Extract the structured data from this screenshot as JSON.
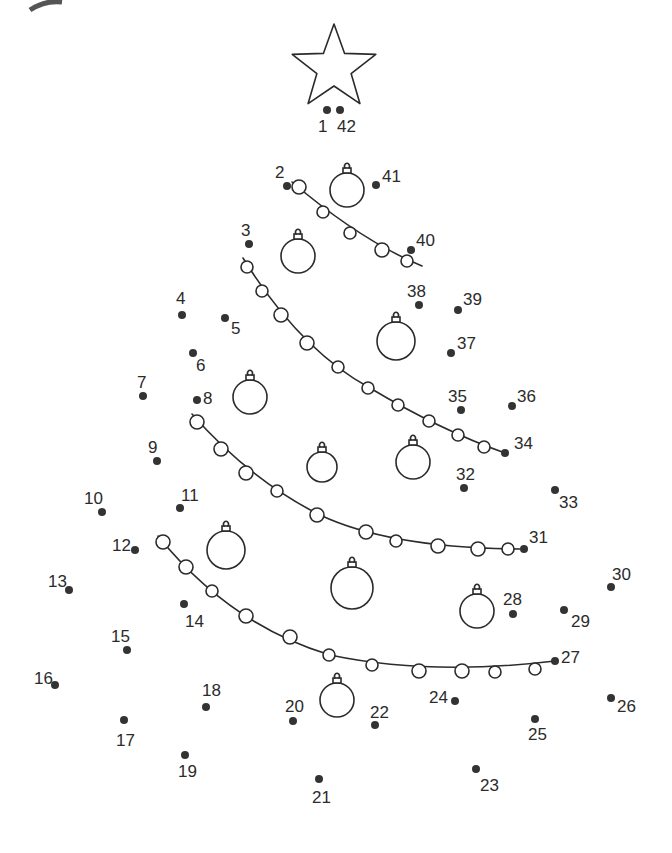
{
  "colors": {
    "ink": "#2b2b2b",
    "dot": "#333333",
    "background": "#ffffff"
  },
  "star": {
    "cx": 334,
    "cy": 68,
    "outer_r": 44,
    "inner_r": 18
  },
  "dots": [
    {
      "n": "1",
      "x": 327,
      "y": 110,
      "lx": 318,
      "ly": 132
    },
    {
      "n": "2",
      "x": 287,
      "y": 186,
      "lx": 275,
      "ly": 178
    },
    {
      "n": "3",
      "x": 249,
      "y": 244,
      "lx": 241,
      "ly": 236
    },
    {
      "n": "4",
      "x": 182,
      "y": 315,
      "lx": 176,
      "ly": 304
    },
    {
      "n": "5",
      "x": 225,
      "y": 318,
      "lx": 231,
      "ly": 334
    },
    {
      "n": "6",
      "x": 193,
      "y": 353,
      "lx": 196,
      "ly": 371
    },
    {
      "n": "7",
      "x": 143,
      "y": 396,
      "lx": 137,
      "ly": 388
    },
    {
      "n": "8",
      "x": 197,
      "y": 400,
      "lx": 203,
      "ly": 404
    },
    {
      "n": "9",
      "x": 157,
      "y": 461,
      "lx": 148,
      "ly": 453
    },
    {
      "n": "10",
      "x": 102,
      "y": 512,
      "lx": 84,
      "ly": 504
    },
    {
      "n": "11",
      "x": 180,
      "y": 508,
      "lx": 181,
      "ly": 501
    },
    {
      "n": "12",
      "x": 135,
      "y": 550,
      "lx": 112,
      "ly": 551
    },
    {
      "n": "13",
      "x": 69,
      "y": 590,
      "lx": 48,
      "ly": 587
    },
    {
      "n": "14",
      "x": 184,
      "y": 604,
      "lx": 185,
      "ly": 627
    },
    {
      "n": "15",
      "x": 127,
      "y": 650,
      "lx": 111,
      "ly": 642
    },
    {
      "n": "16",
      "x": 55,
      "y": 685,
      "lx": 34,
      "ly": 684
    },
    {
      "n": "17",
      "x": 124,
      "y": 720,
      "lx": 116,
      "ly": 746
    },
    {
      "n": "18",
      "x": 206,
      "y": 707,
      "lx": 202,
      "ly": 696
    },
    {
      "n": "19",
      "x": 185,
      "y": 755,
      "lx": 178,
      "ly": 777
    },
    {
      "n": "20",
      "x": 293,
      "y": 721,
      "lx": 285,
      "ly": 712
    },
    {
      "n": "21",
      "x": 319,
      "y": 779,
      "lx": 312,
      "ly": 803
    },
    {
      "n": "22",
      "x": 375,
      "y": 725,
      "lx": 370,
      "ly": 718
    },
    {
      "n": "23",
      "x": 476,
      "y": 769,
      "lx": 480,
      "ly": 791
    },
    {
      "n": "24",
      "x": 455,
      "y": 701,
      "lx": 429,
      "ly": 703
    },
    {
      "n": "25",
      "x": 535,
      "y": 719,
      "lx": 528,
      "ly": 740
    },
    {
      "n": "26",
      "x": 611,
      "y": 698,
      "lx": 617,
      "ly": 712
    },
    {
      "n": "27",
      "x": 555,
      "y": 661,
      "lx": 561,
      "ly": 663
    },
    {
      "n": "28",
      "x": 513,
      "y": 614,
      "lx": 503,
      "ly": 605
    },
    {
      "n": "29",
      "x": 564,
      "y": 610,
      "lx": 571,
      "ly": 627
    },
    {
      "n": "30",
      "x": 611,
      "y": 587,
      "lx": 612,
      "ly": 580
    },
    {
      "n": "31",
      "x": 524,
      "y": 549,
      "lx": 529,
      "ly": 543
    },
    {
      "n": "32",
      "x": 464,
      "y": 488,
      "lx": 456,
      "ly": 480
    },
    {
      "n": "33",
      "x": 555,
      "y": 490,
      "lx": 559,
      "ly": 508
    },
    {
      "n": "34",
      "x": 505,
      "y": 453,
      "lx": 514,
      "ly": 449
    },
    {
      "n": "35",
      "x": 461,
      "y": 410,
      "lx": 448,
      "ly": 402
    },
    {
      "n": "36",
      "x": 512,
      "y": 406,
      "lx": 517,
      "ly": 402
    },
    {
      "n": "37",
      "x": 451,
      "y": 353,
      "lx": 457,
      "ly": 349
    },
    {
      "n": "38",
      "x": 419,
      "y": 305,
      "lx": 407,
      "ly": 297
    },
    {
      "n": "39",
      "x": 458,
      "y": 310,
      "lx": 463,
      "ly": 305
    },
    {
      "n": "40",
      "x": 411,
      "y": 250,
      "lx": 416,
      "ly": 246
    },
    {
      "n": "41",
      "x": 376,
      "y": 185,
      "lx": 382,
      "ly": 182
    },
    {
      "n": "42",
      "x": 340,
      "y": 110,
      "lx": 337,
      "ly": 132
    }
  ],
  "garlands": [
    {
      "path": "M292,182 Q360,240 422,266",
      "beads": [
        [
          299,
          187,
          7
        ],
        [
          323,
          212,
          6
        ],
        [
          350,
          233,
          6
        ],
        [
          382,
          250,
          7
        ],
        [
          407,
          261,
          6
        ]
      ]
    },
    {
      "path": "M243,258 Q300,350 370,388 Q440,430 505,453",
      "beads": [
        [
          247,
          267,
          6
        ],
        [
          262,
          291,
          6
        ],
        [
          281,
          315,
          7
        ],
        [
          307,
          343,
          7
        ],
        [
          338,
          367,
          6
        ],
        [
          368,
          388,
          6
        ],
        [
          398,
          405,
          6
        ],
        [
          429,
          421,
          6
        ],
        [
          458,
          435,
          6
        ],
        [
          484,
          447,
          6
        ]
      ]
    },
    {
      "path": "M192,414 Q250,480 320,515 Q390,548 520,549",
      "beads": [
        [
          197,
          422,
          7
        ],
        [
          221,
          449,
          7
        ],
        [
          246,
          473,
          7
        ],
        [
          277,
          491,
          6
        ],
        [
          317,
          515,
          7
        ],
        [
          366,
          532,
          7
        ],
        [
          396,
          541,
          6
        ],
        [
          438,
          546,
          7
        ],
        [
          478,
          549,
          7
        ],
        [
          508,
          549,
          6
        ]
      ]
    },
    {
      "path": "M158,536 Q230,625 330,655 Q430,676 555,661",
      "beads": [
        [
          163,
          542,
          7
        ],
        [
          186,
          567,
          7
        ],
        [
          212,
          591,
          6
        ],
        [
          246,
          616,
          7
        ],
        [
          290,
          637,
          7
        ],
        [
          329,
          655,
          6
        ],
        [
          372,
          665,
          6
        ],
        [
          419,
          671,
          7
        ],
        [
          462,
          671,
          7
        ],
        [
          495,
          672,
          6
        ],
        [
          535,
          669,
          6
        ]
      ]
    }
  ],
  "ornaments": [
    {
      "cx": 347,
      "cy": 190,
      "r": 17
    },
    {
      "cx": 298,
      "cy": 256,
      "r": 17
    },
    {
      "cx": 396,
      "cy": 341,
      "r": 19
    },
    {
      "cx": 250,
      "cy": 397,
      "r": 17
    },
    {
      "cx": 322,
      "cy": 467,
      "r": 15
    },
    {
      "cx": 413,
      "cy": 462,
      "r": 17
    },
    {
      "cx": 226,
      "cy": 550,
      "r": 19
    },
    {
      "cx": 352,
      "cy": 588,
      "r": 21
    },
    {
      "cx": 477,
      "cy": 611,
      "r": 17
    },
    {
      "cx": 337,
      "cy": 700,
      "r": 17
    }
  ]
}
